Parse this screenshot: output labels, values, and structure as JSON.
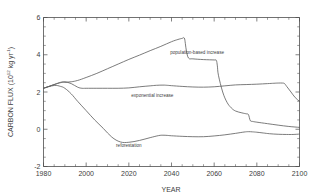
{
  "figure": {
    "background_color": "#ffffff",
    "line_color": "#5a5a5a",
    "axis_color": "#4d4d4d",
    "text_color": "#3d3d3d"
  },
  "axes": {
    "x_title": "YEAR",
    "y_title_main": "CARBON FLUX  (10",
    "y_title_exp1": "12",
    "y_title_mid": " kg yr",
    "y_title_exp2": "-1",
    "y_title_close": ")",
    "y_title_full": "CARBON FLUX (10^12 kg yr^-1)",
    "x_ticklabels": [
      "1980",
      "2000",
      "2020",
      "2040",
      "2060",
      "2080",
      "2100"
    ],
    "y_ticklabels": [
      "-2",
      "0",
      "2",
      "4",
      "6"
    ]
  },
  "annotations": {
    "population": "population-based increase",
    "exponential": "exponential increase",
    "reforestation": "reforestation"
  },
  "chart_data": {
    "type": "line",
    "title": "",
    "xlabel": "YEAR",
    "ylabel": "CARBON FLUX (10^12 kg yr^-1)",
    "xlim": [
      1980,
      2100
    ],
    "ylim": [
      -2,
      6
    ],
    "xticks": [
      1980,
      2000,
      2020,
      2040,
      2060,
      2080,
      2100
    ],
    "yticks": [
      -2,
      0,
      2,
      4,
      6
    ],
    "xminor_step": 5,
    "yminor_step": 0.5,
    "grid": false,
    "legend": "inline-annotations",
    "series": [
      {
        "name": "population-based increase",
        "label_x": 2052,
        "label_y": 4.05,
        "x": [
          1980,
          1985,
          1988,
          1990,
          1993,
          1996,
          2000,
          2005,
          2010,
          2015,
          2020,
          2025,
          2030,
          2035,
          2040,
          2043,
          2045,
          2046,
          2046.5,
          2047,
          2048,
          2050,
          2055,
          2060,
          2061,
          2061.5,
          2062,
          2064,
          2066,
          2068,
          2070,
          2073,
          2075,
          2076,
          2076.5,
          2077,
          2078,
          2080,
          2085,
          2090,
          2095,
          2100
        ],
        "y": [
          2.2,
          2.4,
          2.5,
          2.52,
          2.55,
          2.62,
          2.78,
          3.0,
          3.25,
          3.5,
          3.75,
          3.98,
          4.22,
          4.45,
          4.7,
          4.82,
          4.88,
          4.9,
          4.6,
          4.2,
          3.82,
          3.78,
          3.74,
          3.72,
          3.7,
          3.4,
          2.9,
          2.0,
          1.45,
          1.15,
          0.98,
          0.88,
          0.83,
          0.8,
          0.62,
          0.45,
          0.42,
          0.38,
          0.3,
          0.22,
          0.15,
          0.1
        ]
      },
      {
        "name": "exponential increase",
        "label_x": 2031,
        "label_y": 1.74,
        "x": [
          1980,
          1985,
          1988,
          1990,
          1993,
          1996,
          1998,
          2000,
          2005,
          2010,
          2015,
          2020,
          2025,
          2030,
          2033,
          2036,
          2038,
          2040,
          2045,
          2050,
          2055,
          2060,
          2065,
          2070,
          2075,
          2080,
          2085,
          2088,
          2090,
          2092,
          2093,
          2094,
          2096,
          2098,
          2100
        ],
        "y": [
          2.2,
          2.4,
          2.52,
          2.55,
          2.45,
          2.26,
          2.2,
          2.2,
          2.2,
          2.2,
          2.2,
          2.22,
          2.28,
          2.33,
          2.36,
          2.37,
          2.36,
          2.34,
          2.3,
          2.27,
          2.26,
          2.28,
          2.33,
          2.38,
          2.4,
          2.42,
          2.45,
          2.47,
          2.48,
          2.48,
          2.45,
          2.3,
          2.0,
          1.7,
          1.5
        ]
      },
      {
        "name": "reforestation",
        "label_x": 2020,
        "label_y": -0.96,
        "x": [
          1980,
          1985,
          1988,
          1990,
          1993,
          1996,
          2000,
          2004,
          2008,
          2012,
          2016,
          2020,
          2025,
          2030,
          2034,
          2036,
          2038,
          2040,
          2045,
          2050,
          2055,
          2060,
          2065,
          2070,
          2074,
          2076,
          2078,
          2080,
          2083,
          2086,
          2090,
          2094,
          2097,
          2100
        ],
        "y": [
          2.2,
          2.35,
          2.3,
          2.2,
          1.9,
          1.5,
          1.0,
          0.5,
          0.05,
          -0.42,
          -0.68,
          -0.7,
          -0.6,
          -0.45,
          -0.34,
          -0.32,
          -0.33,
          -0.35,
          -0.38,
          -0.4,
          -0.4,
          -0.36,
          -0.3,
          -0.22,
          -0.15,
          -0.13,
          -0.14,
          -0.16,
          -0.2,
          -0.24,
          -0.27,
          -0.28,
          -0.28,
          -0.26
        ]
      }
    ]
  }
}
